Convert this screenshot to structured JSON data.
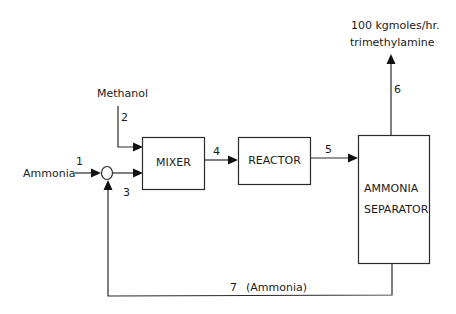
{
  "diagram": {
    "type": "process-flow-diagram",
    "units": [
      {
        "id": "mixer",
        "label": "MIXER"
      },
      {
        "id": "reactor",
        "label": "REACTOR"
      },
      {
        "id": "separator",
        "label_line1": "AMMONIA",
        "label_line2": "SEPARATOR"
      }
    ],
    "junction": {
      "id": "recycle-junction",
      "shape": "circle"
    },
    "streams": [
      {
        "number": "1",
        "from": "feed",
        "to": "recycle-junction",
        "label": "Ammonia"
      },
      {
        "number": "2",
        "from": "feed",
        "to": "mixer",
        "label": "Methanol"
      },
      {
        "number": "3",
        "from": "recycle-junction",
        "to": "mixer",
        "label": ""
      },
      {
        "number": "4",
        "from": "mixer",
        "to": "reactor",
        "label": ""
      },
      {
        "number": "5",
        "from": "reactor",
        "to": "separator",
        "label": ""
      },
      {
        "number": "6",
        "from": "separator",
        "to": "product",
        "label_line1": "100  kgmoles/hr.",
        "label_line2": "trimethylamine"
      },
      {
        "number": "7",
        "from": "separator",
        "to": "recycle-junction",
        "label": "(Ammonia)"
      }
    ]
  }
}
